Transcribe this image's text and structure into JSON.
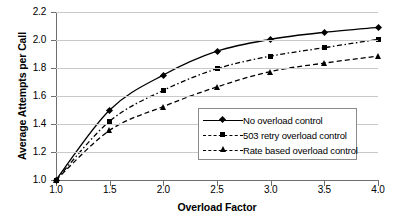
{
  "chart_data": {
    "type": "line",
    "title": "",
    "xlabel": "Overload Factor",
    "ylabel": "Average Attempts per Call",
    "xlim": [
      1.0,
      4.0
    ],
    "ylim": [
      1.0,
      2.2
    ],
    "grid": true,
    "legend_position": "center-right-inside",
    "x": [
      1.0,
      1.5,
      2.0,
      2.5,
      3.0,
      3.5,
      4.0
    ],
    "xticks": [
      "1.0",
      "1.5",
      "2.0",
      "2.5",
      "3.0",
      "3.5",
      "4.0"
    ],
    "yticks": [
      "1.0",
      "1.2",
      "1.4",
      "1.6",
      "1.8",
      "2.0",
      "2.2"
    ],
    "series": [
      {
        "name": "No overload control",
        "marker": "diamond",
        "linestyle": "solid",
        "color": "#000000",
        "values": [
          1.0,
          1.5,
          1.75,
          1.92,
          2.005,
          2.055,
          2.09
        ]
      },
      {
        "name": "503 retry overload control",
        "marker": "square",
        "linestyle": "dash-dot",
        "color": "#000000",
        "values": [
          1.0,
          1.42,
          1.64,
          1.795,
          1.885,
          1.945,
          2.005
        ]
      },
      {
        "name": "Rate based overload control",
        "marker": "triangle",
        "linestyle": "dashed",
        "color": "#000000",
        "values": [
          1.0,
          1.355,
          1.525,
          1.665,
          1.775,
          1.835,
          1.885
        ]
      }
    ]
  }
}
